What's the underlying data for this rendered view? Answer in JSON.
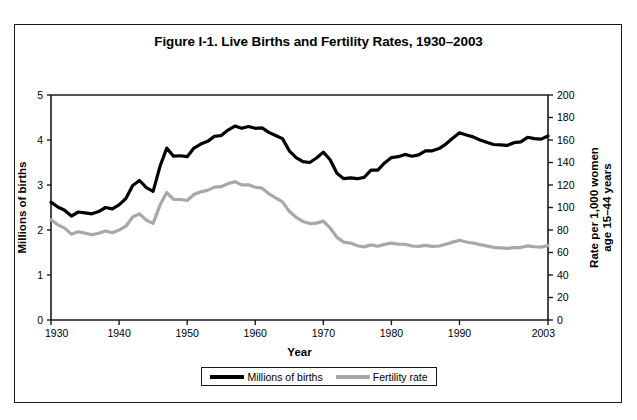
{
  "figure": {
    "title": "Figure I-1. Live Births and Fertility Rates, 1930–2003",
    "frame_color": "#1a1a1a",
    "background": "#ffffff"
  },
  "legend": {
    "position": "bottom-center",
    "entries": [
      {
        "label": "Millions of births",
        "color": "#000000",
        "swatch": "line-swatch-black"
      },
      {
        "label": "Fertility rate",
        "color": "#a8a8a8",
        "swatch": "line-swatch-gray"
      }
    ]
  },
  "axes": {
    "x": {
      "title": "Year",
      "min": 1930,
      "max": 2003,
      "ticks": [
        1930,
        1940,
        1950,
        1960,
        1970,
        1980,
        1990,
        2003
      ],
      "tick_labels": [
        "1930",
        "1940",
        "1950",
        "1960",
        "1970",
        "1980",
        "1990",
        "2003"
      ]
    },
    "y_left": {
      "title": "Millions of births",
      "min": 0,
      "max": 5,
      "ticks": [
        0,
        1,
        2,
        3,
        4,
        5
      ],
      "tick_labels": [
        "0",
        "1",
        "2",
        "3",
        "4",
        "5"
      ]
    },
    "y_right": {
      "title": "Rate per 1,000 women age 15–44 years",
      "min": 0,
      "max": 200,
      "ticks": [
        0,
        20,
        40,
        60,
        80,
        100,
        120,
        140,
        160,
        180,
        200
      ],
      "tick_labels": [
        "0",
        "20",
        "40",
        "60",
        "80",
        "100",
        "120",
        "140",
        "160",
        "180",
        "200"
      ]
    }
  },
  "chart_data": {
    "type": "line",
    "title": "Figure I-1. Live Births and Fertility Rates, 1930–2003",
    "xlabel": "Year",
    "ylabel": "Millions of births",
    "ylabel_secondary": "Rate per 1,000 women age 15–44 years",
    "xlim": [
      1930,
      2003
    ],
    "ylim": [
      0,
      5
    ],
    "ylim_secondary": [
      0,
      200
    ],
    "grid": false,
    "legend_position": "bottom-center",
    "x": [
      1930,
      1931,
      1932,
      1933,
      1934,
      1935,
      1936,
      1937,
      1938,
      1939,
      1940,
      1941,
      1942,
      1943,
      1944,
      1945,
      1946,
      1947,
      1948,
      1949,
      1950,
      1951,
      1952,
      1953,
      1954,
      1955,
      1956,
      1957,
      1958,
      1959,
      1960,
      1961,
      1962,
      1963,
      1964,
      1965,
      1966,
      1967,
      1968,
      1969,
      1970,
      1971,
      1972,
      1973,
      1974,
      1975,
      1976,
      1977,
      1978,
      1979,
      1980,
      1981,
      1982,
      1983,
      1984,
      1985,
      1986,
      1987,
      1988,
      1989,
      1990,
      1991,
      1992,
      1993,
      1994,
      1995,
      1996,
      1997,
      1998,
      1999,
      2000,
      2001,
      2002,
      2003
    ],
    "series": [
      {
        "name": "Millions of births",
        "axis": "left",
        "color": "#000000",
        "units": "millions",
        "values": [
          2.62,
          2.51,
          2.44,
          2.31,
          2.4,
          2.38,
          2.36,
          2.41,
          2.5,
          2.47,
          2.56,
          2.7,
          2.99,
          3.1,
          2.94,
          2.86,
          3.41,
          3.82,
          3.64,
          3.65,
          3.63,
          3.82,
          3.91,
          3.97,
          4.08,
          4.1,
          4.22,
          4.31,
          4.26,
          4.3,
          4.26,
          4.27,
          4.17,
          4.1,
          4.03,
          3.76,
          3.61,
          3.52,
          3.5,
          3.6,
          3.73,
          3.56,
          3.26,
          3.14,
          3.16,
          3.14,
          3.17,
          3.33,
          3.33,
          3.49,
          3.61,
          3.63,
          3.68,
          3.64,
          3.67,
          3.76,
          3.76,
          3.81,
          3.91,
          4.04,
          4.16,
          4.11,
          4.07,
          4.0,
          3.95,
          3.9,
          3.89,
          3.88,
          3.94,
          3.96,
          4.06,
          4.03,
          4.02,
          4.09
        ]
      },
      {
        "name": "Fertility rate",
        "axis": "right",
        "color": "#a8a8a8",
        "units": "births per 1,000 women aged 15-44",
        "values": [
          89.2,
          84.6,
          81.7,
          76.3,
          78.5,
          77.2,
          75.8,
          77.1,
          79.1,
          77.6,
          79.9,
          83.4,
          91.5,
          94.3,
          88.8,
          85.9,
          101.9,
          113.3,
          107.3,
          107.1,
          106.2,
          111.5,
          113.9,
          115.2,
          118.1,
          118.5,
          121.2,
          122.9,
          120.2,
          120.2,
          118.0,
          117.2,
          112.2,
          108.5,
          105.0,
          96.6,
          91.3,
          87.6,
          85.7,
          86.1,
          87.9,
          81.8,
          73.4,
          69.2,
          68.4,
          66.0,
          65.0,
          66.8,
          65.5,
          67.2,
          68.4,
          67.4,
          67.3,
          65.8,
          65.5,
          66.3,
          65.4,
          65.8,
          67.3,
          69.2,
          70.9,
          69.3,
          68.4,
          67.0,
          65.9,
          64.6,
          64.1,
          63.6,
          64.3,
          64.4,
          65.9,
          65.1,
          64.8,
          66.1
        ]
      }
    ]
  }
}
